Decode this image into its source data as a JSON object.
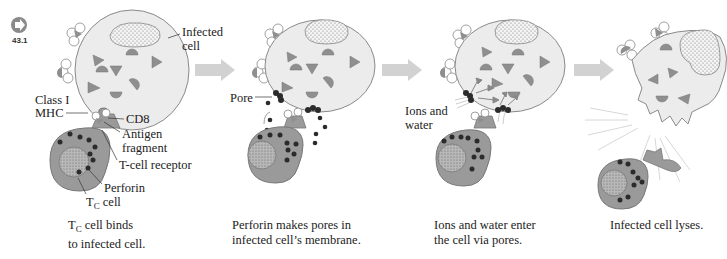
{
  "figure": {
    "number": "43.1",
    "icon": "arrow-right-circle-icon",
    "colors": {
      "infected_cell_fill": "#ececec",
      "infected_cell_stroke": "#8a8a8a",
      "tc_cell_fill": "#9a9a9a",
      "perforin": "#2b2b2b",
      "antigen": "#8f8f8f",
      "step_arrow": "#d2d2d2"
    }
  },
  "panels": [
    {
      "caption_line1_prefix": "T",
      "caption_line1_sub": "C",
      "caption_line1_suffix": " cell binds",
      "caption_line2": "to infected cell.",
      "labels": {
        "infected_cell_1": "Infected",
        "infected_cell_2": "cell",
        "class1_mhc_1": "Class I",
        "class1_mhc_2": "MHC",
        "cd8": "CD8",
        "antigen_1": "Antigen",
        "antigen_2": "fragment",
        "tcr": "T-cell receptor",
        "perforin": "Perforin",
        "tc_cell_prefix": "T",
        "tc_cell_sub": "C",
        "tc_cell_suffix": " cell"
      }
    },
    {
      "caption_line1": "Perforin makes pores in",
      "caption_line2": "infected cell’s membrane.",
      "labels": {
        "pore": "Pore"
      }
    },
    {
      "caption_line1": "Ions and water enter",
      "caption_line2": "the cell via pores.",
      "labels": {
        "ions_1": "Ions and",
        "ions_2": "water"
      }
    },
    {
      "caption_line1": "Infected cell lyses."
    }
  ]
}
